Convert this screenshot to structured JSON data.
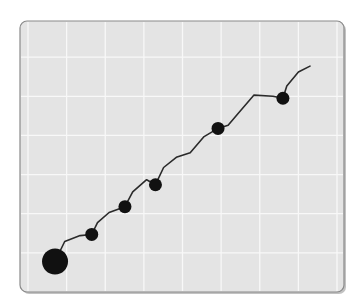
{
  "chart_data": {
    "type": "line",
    "title": "",
    "xlabel": "",
    "ylabel": "",
    "grid": true,
    "legend": null,
    "xlim": [
      0,
      8
    ],
    "ylim": [
      0,
      7
    ],
    "series": [
      {
        "name": "trend",
        "line_points": [
          [
            0.7,
            0.78
          ],
          [
            0.95,
            1.29
          ],
          [
            1.35,
            1.44
          ],
          [
            1.65,
            1.47
          ],
          [
            1.8,
            1.77
          ],
          [
            2.1,
            2.03
          ],
          [
            2.51,
            2.18
          ],
          [
            2.71,
            2.56
          ],
          [
            3.07,
            2.87
          ],
          [
            3.3,
            2.74
          ],
          [
            3.51,
            3.18
          ],
          [
            3.84,
            3.44
          ],
          [
            4.2,
            3.56
          ],
          [
            4.56,
            3.97
          ],
          [
            4.92,
            4.18
          ],
          [
            5.18,
            4.26
          ],
          [
            5.44,
            4.56
          ],
          [
            5.85,
            5.03
          ],
          [
            6.34,
            5.0
          ],
          [
            6.6,
            4.95
          ],
          [
            6.7,
            5.26
          ],
          [
            7.0,
            5.62
          ],
          [
            7.3,
            5.77
          ]
        ],
        "markers": [
          {
            "x": 0.7,
            "y": 0.78,
            "size": "large"
          },
          {
            "x": 1.65,
            "y": 1.47,
            "size": "medium"
          },
          {
            "x": 2.51,
            "y": 2.18,
            "size": "medium"
          },
          {
            "x": 3.3,
            "y": 2.74,
            "size": "medium"
          },
          {
            "x": 4.92,
            "y": 4.18,
            "size": "medium"
          },
          {
            "x": 6.6,
            "y": 4.95,
            "size": "medium"
          }
        ]
      }
    ],
    "colors": {
      "panel": "#e4e4e4",
      "panel_border": "#8a8a8a",
      "grid": "#f8f8f8",
      "line": "#2a2a2a",
      "marker": "#111111"
    }
  }
}
